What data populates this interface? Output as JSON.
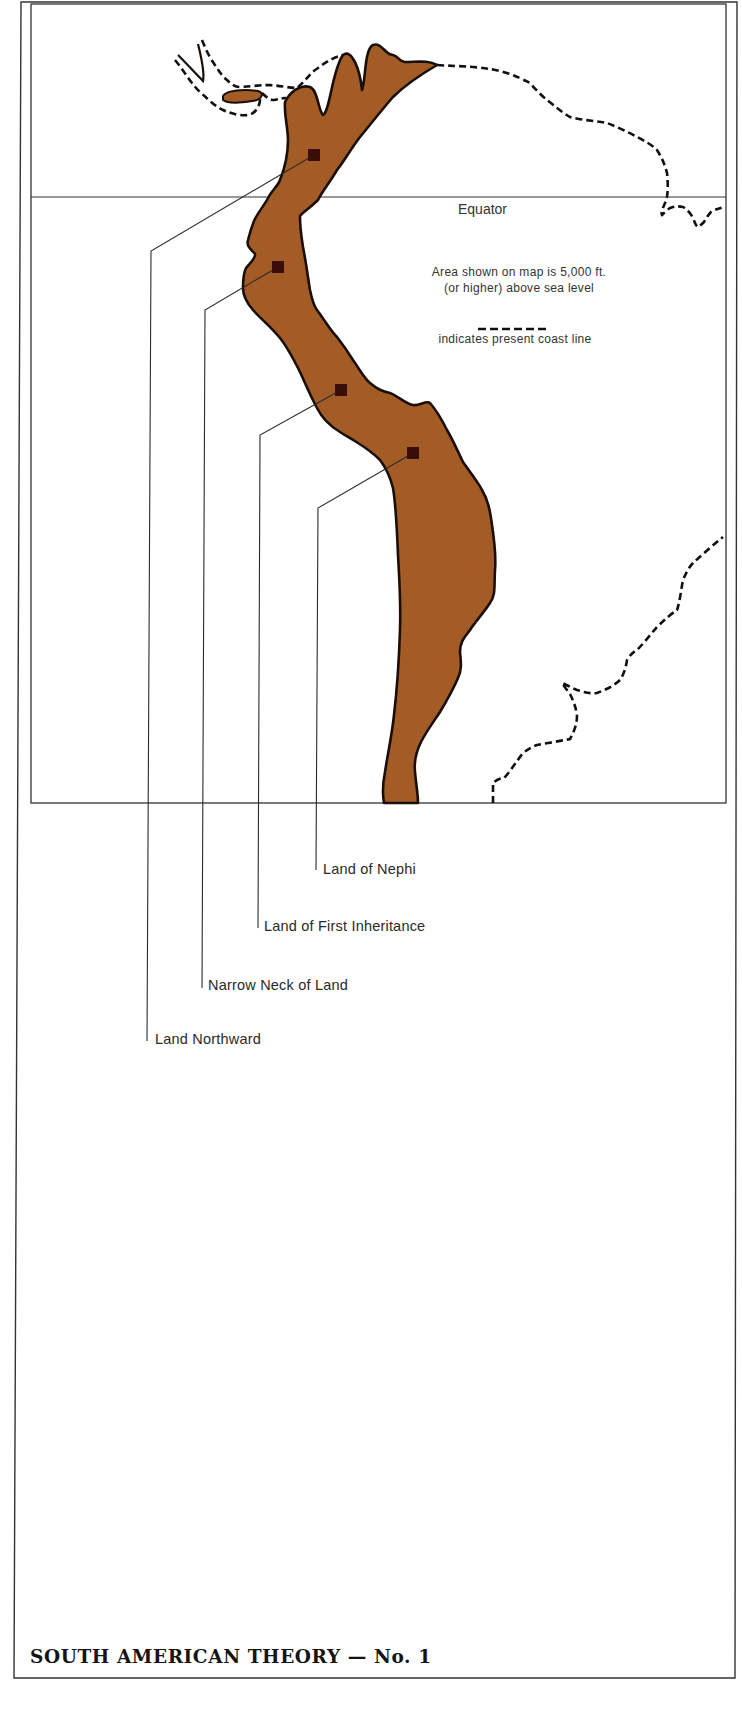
{
  "map": {
    "title": "SOUTH AMERICAN THEORY — No. 1",
    "equator_label": "Equator",
    "legend": {
      "area_line1": "Area shown on map is 5,000 ft.",
      "area_line2": "(or higher) above sea level",
      "coast_label": "indicates present coast line"
    },
    "places": [
      {
        "id": "land-northward",
        "label": "Land Northward",
        "marker": [
          314,
          155
        ]
      },
      {
        "id": "narrow-neck",
        "label": "Narrow Neck of Land",
        "marker": [
          278,
          267
        ]
      },
      {
        "id": "first-inheritance",
        "label": "Land of First Inheritance",
        "marker": [
          341,
          390
        ]
      },
      {
        "id": "land-of-nephi",
        "label": "Land of Nephi",
        "marker": [
          413,
          453
        ]
      }
    ],
    "colors": {
      "highland_fill": "#a45c26",
      "outline": "#1a0f08",
      "marker": "#3a0d08",
      "lines": "#333333"
    }
  }
}
